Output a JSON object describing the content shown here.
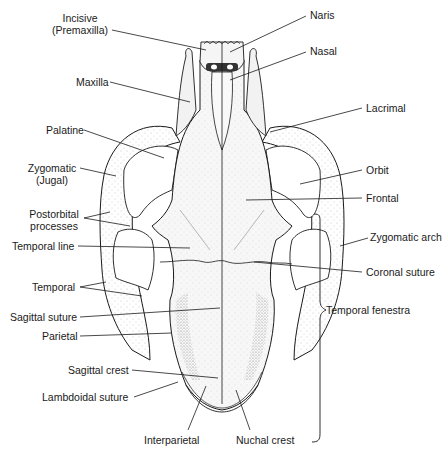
{
  "diagram": {
    "labels_left": [
      {
        "id": "incisive",
        "text": "Incisive\n(Premaxilla)"
      },
      {
        "id": "maxilla",
        "text": "Maxilla"
      },
      {
        "id": "palatine",
        "text": "Palatine"
      },
      {
        "id": "zygomatic-jugal",
        "text": "Zygomatic\n(Jugal)"
      },
      {
        "id": "postorbital-processes",
        "text": "Postorbital\nprocesses"
      },
      {
        "id": "temporal-line",
        "text": "Temporal line"
      },
      {
        "id": "temporal",
        "text": "Temporal"
      },
      {
        "id": "sagittal-suture",
        "text": "Sagittal suture"
      },
      {
        "id": "parietal",
        "text": "Parietal"
      },
      {
        "id": "sagittal-crest",
        "text": "Sagittal crest"
      },
      {
        "id": "lambdoidal-suture",
        "text": "Lambdoidal suture"
      }
    ],
    "labels_right": [
      {
        "id": "naris",
        "text": "Naris"
      },
      {
        "id": "nasal",
        "text": "Nasal"
      },
      {
        "id": "lacrimal",
        "text": "Lacrimal"
      },
      {
        "id": "orbit",
        "text": "Orbit"
      },
      {
        "id": "frontal",
        "text": "Frontal"
      },
      {
        "id": "zygomatic-arch",
        "text": "Zygomatic arch"
      },
      {
        "id": "coronal-suture",
        "text": "Coronal suture"
      },
      {
        "id": "temporal-fenestra",
        "text": "Temporal fenestra"
      }
    ],
    "labels_bottom": [
      {
        "id": "interparietal",
        "text": "Interparietal"
      },
      {
        "id": "nuchal-crest",
        "text": "Nuchal crest"
      }
    ],
    "colors": {
      "line": "#1a1a1a",
      "bone_fill": "#f4f4f4",
      "stipple": "#9a9a9a",
      "background": "#ffffff"
    }
  }
}
